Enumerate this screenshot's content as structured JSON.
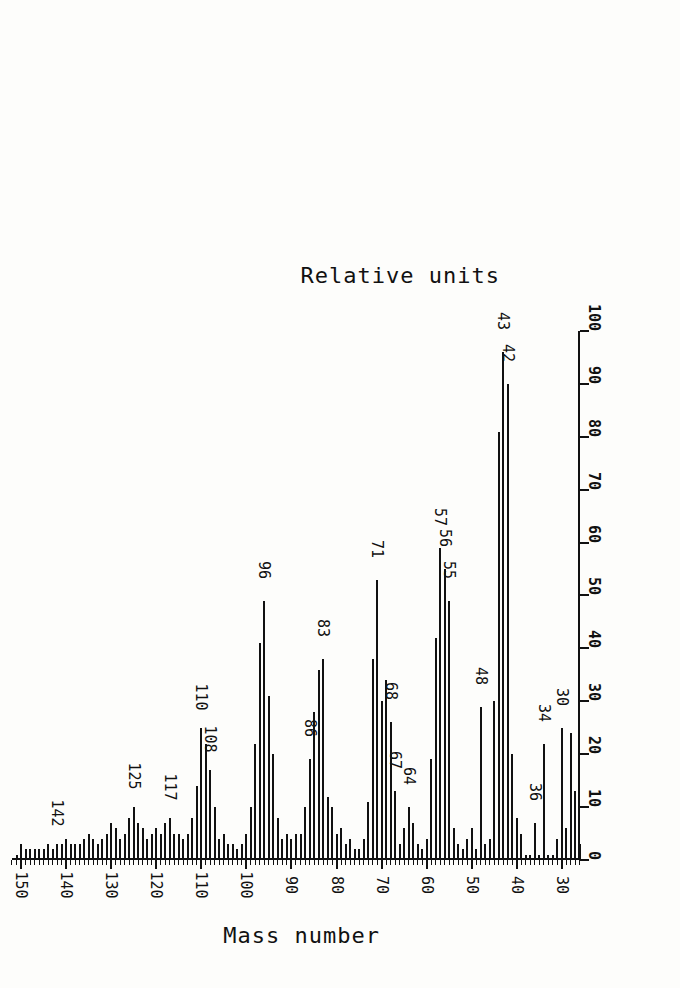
{
  "figure": {
    "kind": "mass-spectrum",
    "orientation": "rotated-180",
    "background_color": "#fdfdfb",
    "ink_color": "#111111"
  },
  "axes": {
    "mass": {
      "title": "Mass number",
      "ticks_major": [
        30,
        40,
        50,
        60,
        70,
        80,
        90,
        100,
        110,
        120,
        130,
        140,
        150
      ],
      "tick_labels": [
        "30",
        "40",
        "50",
        "60",
        "70",
        "80",
        "90",
        "100",
        "110",
        "120",
        "130",
        "140",
        "150"
      ],
      "minor_tick_step": 1,
      "range": [
        26,
        152
      ]
    },
    "intensity": {
      "title": "Relative units",
      "ticks": [
        0,
        10,
        20,
        30,
        40,
        50,
        60,
        70,
        80,
        90,
        100
      ],
      "tick_labels": [
        "0",
        "10",
        "20",
        "30",
        "40",
        "50",
        "60",
        "70",
        "80",
        "90",
        "100"
      ],
      "range": [
        0,
        100
      ]
    }
  },
  "annotations": [
    {
      "mass": 30,
      "text": "30"
    },
    {
      "mass": 34,
      "text": "34"
    },
    {
      "mass": 36,
      "text": "36"
    },
    {
      "mass": 42,
      "text": "42"
    },
    {
      "mass": 43,
      "text": "43"
    },
    {
      "mass": 48,
      "text": "48"
    },
    {
      "mass": 55,
      "text": "55"
    },
    {
      "mass": 56,
      "text": "56"
    },
    {
      "mass": 57,
      "text": "57"
    },
    {
      "mass": 64,
      "text": "64"
    },
    {
      "mass": 67,
      "text": "67"
    },
    {
      "mass": 68,
      "text": "68"
    },
    {
      "mass": 71,
      "text": "71"
    },
    {
      "mass": 83,
      "text": "83"
    },
    {
      "mass": 86,
      "text": "86"
    },
    {
      "mass": 96,
      "text": "96"
    },
    {
      "mass": 108,
      "text": "108"
    },
    {
      "mass": 110,
      "text": "110"
    },
    {
      "mass": 117,
      "text": "117"
    },
    {
      "mass": 125,
      "text": "125"
    },
    {
      "mass": 142,
      "text": "142"
    }
  ],
  "chart_data": {
    "type": "bar",
    "title": "",
    "xlabel": "Mass number",
    "ylabel": "Relative units",
    "xlim": [
      26,
      152
    ],
    "ylim": [
      0,
      100
    ],
    "grid": false,
    "legend": "none",
    "categories": [
      26,
      27,
      28,
      29,
      30,
      31,
      32,
      33,
      34,
      35,
      36,
      37,
      38,
      39,
      40,
      41,
      42,
      43,
      44,
      45,
      46,
      47,
      48,
      49,
      50,
      51,
      52,
      53,
      54,
      55,
      56,
      57,
      58,
      59,
      60,
      61,
      62,
      63,
      64,
      65,
      66,
      67,
      68,
      69,
      70,
      71,
      72,
      73,
      74,
      75,
      76,
      77,
      78,
      79,
      80,
      81,
      82,
      83,
      84,
      85,
      86,
      87,
      88,
      89,
      90,
      91,
      92,
      93,
      94,
      95,
      96,
      97,
      98,
      99,
      100,
      101,
      102,
      103,
      104,
      105,
      106,
      107,
      108,
      109,
      110,
      111,
      112,
      113,
      114,
      115,
      116,
      117,
      118,
      119,
      120,
      121,
      122,
      123,
      124,
      125,
      126,
      127,
      128,
      129,
      130,
      131,
      132,
      133,
      134,
      135,
      136,
      137,
      138,
      139,
      140,
      141,
      142,
      143,
      144,
      145,
      146,
      147,
      148,
      149,
      150,
      151
    ],
    "values": [
      3,
      13,
      24,
      6,
      25,
      4,
      1,
      1,
      22,
      1,
      7,
      1,
      1,
      5,
      8,
      20,
      90,
      96,
      81,
      30,
      4,
      3,
      29,
      2,
      6,
      4,
      2,
      3,
      6,
      49,
      55,
      59,
      42,
      19,
      4,
      2,
      3,
      7,
      10,
      6,
      3,
      13,
      26,
      34,
      30,
      53,
      38,
      11,
      4,
      2,
      2,
      4,
      3,
      6,
      5,
      10,
      12,
      38,
      36,
      28,
      19,
      10,
      5,
      5,
      4,
      5,
      4,
      8,
      20,
      31,
      49,
      41,
      22,
      10,
      5,
      3,
      2,
      3,
      3,
      5,
      4,
      10,
      17,
      22,
      25,
      14,
      8,
      5,
      4,
      5,
      5,
      8,
      7,
      5,
      6,
      5,
      4,
      6,
      7,
      10,
      8,
      5,
      4,
      6,
      7,
      5,
      4,
      3,
      4,
      5,
      4,
      3,
      3,
      3,
      4,
      3,
      3,
      2,
      3,
      2,
      2,
      2,
      2,
      2,
      3,
      1
    ]
  }
}
